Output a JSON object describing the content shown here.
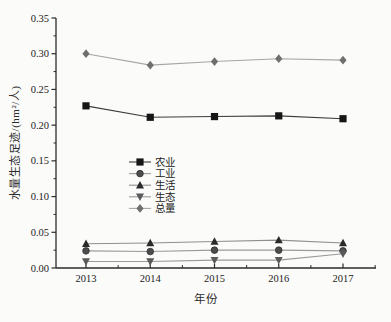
{
  "figure": {
    "background": "#fbfbfa",
    "axis_color": "#2b2b2b"
  },
  "chart_data": {
    "type": "line",
    "title": "",
    "xlabel": "年份",
    "ylabel": "水量生态足迹/(hm²/人)",
    "x": [
      "2013",
      "2014",
      "2015",
      "2016",
      "2017"
    ],
    "ylim": [
      0,
      0.35
    ],
    "ytick_labels": [
      "0.00",
      "0.05",
      "0.10",
      "0.15",
      "0.20",
      "0.25",
      "0.30",
      "0.35"
    ],
    "grid": false,
    "legend_position": "inside-center-left",
    "series": [
      {
        "name": "农业",
        "key": "agriculture",
        "marker": "square",
        "marker_color": "#161616",
        "line_color": "#3c3c3c",
        "values": [
          0.227,
          0.211,
          0.212,
          0.213,
          0.209
        ]
      },
      {
        "name": "工业",
        "key": "industry",
        "marker": "circle",
        "marker_color": "#4c4c4c",
        "line_color": "#9b9b9b",
        "values": [
          0.024,
          0.023,
          0.025,
          0.025,
          0.024
        ]
      },
      {
        "name": "生活",
        "key": "living",
        "marker": "triangle-up",
        "marker_color": "#2a2a2a",
        "line_color": "#8f8f8f",
        "values": [
          0.034,
          0.035,
          0.037,
          0.039,
          0.035
        ]
      },
      {
        "name": "生态",
        "key": "ecology",
        "marker": "triangle-down",
        "marker_color": "#5a5a5a",
        "line_color": "#9b9b9b",
        "values": [
          0.009,
          0.009,
          0.011,
          0.011,
          0.02
        ]
      },
      {
        "name": "总量",
        "key": "total",
        "marker": "diamond",
        "marker_color": "#6f6f6f",
        "line_color": "#a6a6a6",
        "values": [
          0.3,
          0.284,
          0.289,
          0.293,
          0.291
        ]
      }
    ]
  }
}
